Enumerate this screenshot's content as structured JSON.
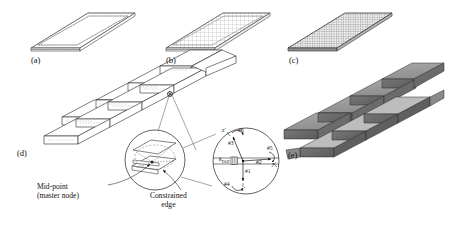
{
  "figure": {
    "panels": [
      {
        "id": "a",
        "label": "(a)",
        "desc": "flat-plate-boundary-mesh-only"
      },
      {
        "id": "b",
        "label": "(b)",
        "desc": "flat-plate-coarse-mesh"
      },
      {
        "id": "c",
        "label": "(c)",
        "desc": "flat-plate-fine-mesh"
      },
      {
        "id": "d",
        "label": "(d)",
        "desc": "folded-corrugated-wireframe"
      },
      {
        "id": "e",
        "label": "(e)",
        "desc": "folded-corrugated-shaded"
      }
    ],
    "annotations": [
      {
        "name": "mid-point-master-node",
        "line1": "Mid-point",
        "line2": "(master node)"
      },
      {
        "name": "constrained-edge",
        "line1": "Constrained",
        "line2": "edge"
      }
    ],
    "detail": {
      "spring_label": "k",
      "spring_subscript": "DOF",
      "dof_labels": [
        "#1",
        "#2",
        "#3",
        "#4",
        "#5",
        "#6"
      ],
      "axes": [
        "x'",
        "y'",
        "z'"
      ]
    },
    "colors": {
      "line": "#1a1a1a",
      "mesh_light": "#b9b9b9",
      "mesh_dark": "#8d8d8d",
      "shade_top": "#9b9b9b",
      "shade_side": "#6f6f6f",
      "shade_dark": "#5a5a5a",
      "shade_light": "#c2c2c2",
      "paper": "#ffffff"
    }
  }
}
